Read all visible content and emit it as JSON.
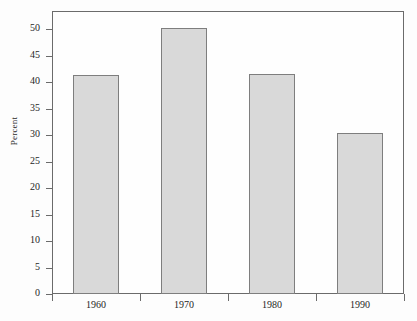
{
  "chart_data": {
    "type": "bar",
    "title": "",
    "xlabel": "",
    "ylabel": "Percent",
    "categories": [
      "1960",
      "1970",
      "1980",
      "1990"
    ],
    "values": [
      41.4,
      50.2,
      41.5,
      30.3
    ],
    "ylim": [
      0,
      52
    ],
    "yticks": [
      0,
      5,
      10,
      15,
      20,
      25,
      30,
      35,
      40,
      45,
      50
    ],
    "ytick_labels": [
      "0",
      "5",
      "10",
      "15",
      "20",
      "25",
      "30",
      "35",
      "40",
      "45",
      "50"
    ],
    "grid": false,
    "legend": null,
    "bar_fill_color": "#d9d9d9",
    "bar_edge_color": "#7e7e7e",
    "axis_color": "#6b6b6b",
    "background_color": "#fdfdfd"
  }
}
